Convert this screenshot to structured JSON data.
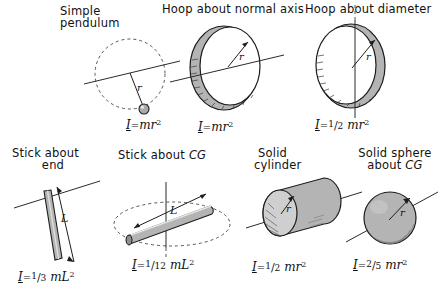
{
  "figure": {
    "background_color": "#ffffff",
    "ink_color": "#111111",
    "shade_color": "#b4b4b4"
  },
  "panels": [
    {
      "id": "simple-pendulum",
      "caption_line1": "Simple",
      "caption_line2": "pendulum",
      "radius_label": "r",
      "formula_symbol": "I",
      "formula_equals": "=",
      "formula_body": "mr",
      "formula_exponent": "2",
      "formula_text": "I = mr 2",
      "shape": "point-mass-on-dashed-circle",
      "axis": "tilted-line"
    },
    {
      "id": "hoop-about-normal-axis",
      "caption_line1": "Hoop about normal axis",
      "caption_line2": "",
      "radius_label": "r",
      "formula_symbol": "I",
      "formula_equals": "=",
      "formula_body": "mr",
      "formula_exponent": "2",
      "formula_text": "I = mr 2",
      "shape": "ring",
      "axis": "tilted-line"
    },
    {
      "id": "hoop-about-diameter",
      "caption_line1": "Hoop about diameter",
      "caption_line2": "",
      "radius_label": "r",
      "formula_symbol": "I",
      "formula_equals": "=",
      "formula_fraction_numerator": "1",
      "formula_fraction_denominator": "2",
      "formula_body": "mr",
      "formula_exponent": "2",
      "formula_text": "I = 1/2 mr 2",
      "shape": "ring",
      "axis": "vertical-line"
    },
    {
      "id": "stick-about-end",
      "caption_line1": "Stick about",
      "caption_line2": "end",
      "length_label": "L",
      "formula_symbol": "I",
      "formula_equals": "=",
      "formula_fraction_numerator": "1",
      "formula_fraction_denominator": "3",
      "formula_body": "mL",
      "formula_exponent": "2",
      "formula_text": "I = 1/3 mL 2",
      "shape": "rod",
      "axis": "tilted-line"
    },
    {
      "id": "stick-about-cg",
      "caption_line1": "Stick about",
      "caption_cg": "CG",
      "length_label": "L",
      "formula_symbol": "I",
      "formula_equals": "=",
      "formula_fraction_numerator": "1",
      "formula_fraction_denominator": "12",
      "formula_body": "mL",
      "formula_exponent": "2",
      "formula_text": "I = 1/12 mL 2",
      "shape": "rod",
      "axis": "vertical-line-with-dashed-ellipse"
    },
    {
      "id": "solid-cylinder",
      "caption_line1": "Solid",
      "caption_line2": "cylinder",
      "radius_label": "r",
      "formula_symbol": "I",
      "formula_equals": "=",
      "formula_fraction_numerator": "1",
      "formula_fraction_denominator": "2",
      "formula_body": "mr",
      "formula_exponent": "2",
      "formula_text": "I = 1/2 mr 2",
      "shape": "cylinder",
      "axis": "tilted-line"
    },
    {
      "id": "solid-sphere-about-cg",
      "caption_line1": "Solid sphere",
      "caption_line2": "about",
      "caption_cg": "CG",
      "radius_label": "r",
      "formula_symbol": "I",
      "formula_equals": "=",
      "formula_fraction_numerator": "2",
      "formula_fraction_denominator": "5",
      "formula_body": "mr",
      "formula_exponent": "2",
      "formula_text": "I = 2/5 mr 2",
      "shape": "sphere",
      "axis": "tilted-line"
    }
  ]
}
